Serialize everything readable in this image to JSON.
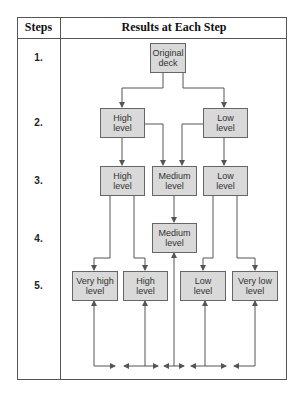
{
  "header": {
    "steps_label": "Steps",
    "results_label": "Results at Each Step"
  },
  "steps": [
    "1.",
    "2.",
    "3.",
    "4.",
    "5."
  ],
  "boxes": {
    "step1": {
      "original_deck": "Original\ndeck"
    },
    "step2": {
      "high": "High\nlevel",
      "low": "Low\nlevel"
    },
    "step3": {
      "high": "High\nlevel",
      "medium": "Medium\nlevel",
      "low": "Low\nlevel"
    },
    "step4": {
      "medium": "Medium\nlevel"
    },
    "step5": {
      "very_high": "Very high\nlevel",
      "high": "High\nlevel",
      "low": "Low\nlevel",
      "very_low": "Very low\nlevel"
    }
  },
  "colors": {
    "box_fill": "#d9d9d9",
    "box_border": "#666666",
    "line": "#555555"
  }
}
